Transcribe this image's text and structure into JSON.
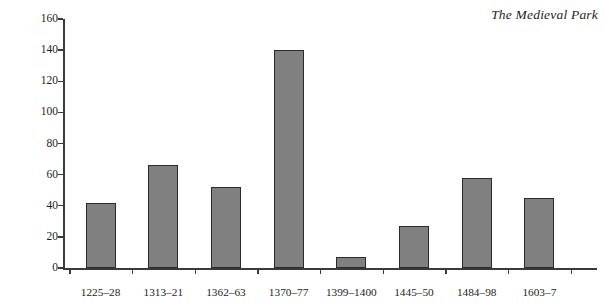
{
  "chart_data": {
    "type": "bar",
    "title": "The Medieval Park",
    "xlabel": "",
    "ylabel": "",
    "categories": [
      "1225–28",
      "1313–21",
      "1362–63",
      "1370–77",
      "1399–1400",
      "1445–50",
      "1484–98",
      "1603–7"
    ],
    "values": [
      42,
      66,
      52,
      140,
      7,
      27,
      58,
      45
    ],
    "ylim": [
      0,
      160
    ],
    "ytick_labels": [
      "0",
      "20",
      "40",
      "60",
      "80",
      "100",
      "120",
      "140",
      "160"
    ],
    "ytick_values": [
      0,
      20,
      40,
      60,
      80,
      100,
      120,
      140,
      160
    ],
    "grid": false,
    "legend": false,
    "bar_color": "#808080",
    "bar_edge_color": "#2b2b2b",
    "axis_color": "#3a3a3a",
    "background": "#ffffff"
  }
}
